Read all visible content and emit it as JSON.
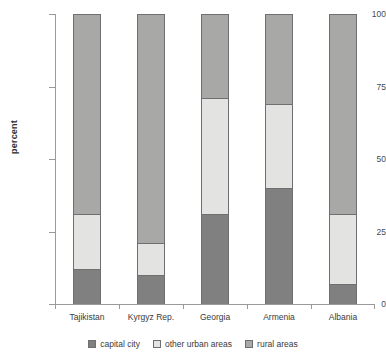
{
  "chart_data": {
    "type": "bar",
    "subtype": "stacked-bar-100",
    "title": "",
    "xlabel": "",
    "ylabel": "percent",
    "ylim": [
      0,
      100
    ],
    "yticks": [
      0,
      25,
      50,
      75,
      100
    ],
    "ytick_labels": [
      "0",
      "25",
      "50",
      "75",
      "100"
    ],
    "grid": false,
    "legend_position": "bottom",
    "categories": [
      "Tajikistan",
      "Kyrgyz Rep.",
      "Georgia",
      "Armenia",
      "Albania"
    ],
    "series": [
      {
        "name": "capital city",
        "color": "#808080",
        "values": [
          12,
          10,
          31,
          40,
          7
        ]
      },
      {
        "name": "other urban areas",
        "color": "#e3e3e1",
        "values": [
          19,
          11,
          40,
          29,
          24
        ]
      },
      {
        "name": "rural areas",
        "color": "#a8a8a6",
        "values": [
          69,
          79,
          29,
          31,
          69
        ]
      }
    ]
  },
  "axis": {
    "y_title": "percent",
    "y_labels": {
      "t0": "0",
      "t25": "25",
      "t50": "50",
      "t75": "75",
      "t100": "100"
    },
    "x_labels": {
      "c0": "Tajikistan",
      "c1": "Kyrgyz Rep.",
      "c2": "Georgia",
      "c3": "Armenia",
      "c4": "Albania"
    }
  },
  "legend": {
    "items": [
      {
        "label": "capital city",
        "color": "#808080"
      },
      {
        "label": "other urban areas",
        "color": "#e3e3e1"
      },
      {
        "label": "rural areas",
        "color": "#a8a8a6"
      }
    ]
  },
  "colors": {
    "capital_city": "#808080",
    "other_urban_areas": "#e3e3e1",
    "rural_areas": "#a8a8a6",
    "axis": "#9a9a9a",
    "text": "#3a3a3a",
    "background": "#ffffff"
  }
}
